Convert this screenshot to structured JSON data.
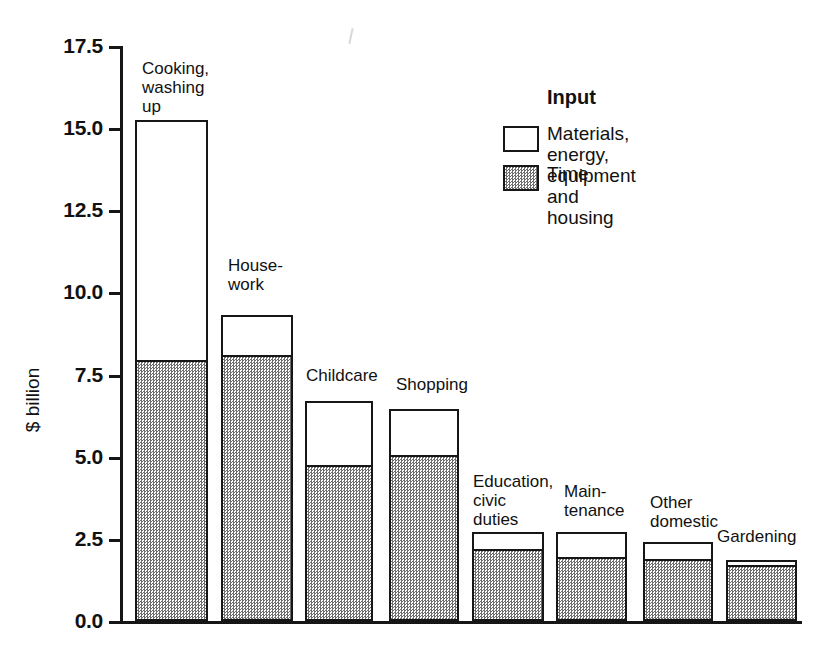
{
  "chart_data": {
    "type": "bar",
    "subtype": "stacked-vertical",
    "title": "",
    "xlabel": "",
    "ylabel": "$ billion",
    "ylim": [
      0.0,
      17.5
    ],
    "yticks": [
      "0.0",
      "2.5",
      "5.0",
      "7.5",
      "10.0",
      "12.5",
      "15.0",
      "17.5"
    ],
    "ytick_values": [
      0.0,
      2.5,
      5.0,
      7.5,
      10.0,
      12.5,
      15.0,
      17.5
    ],
    "grid": false,
    "legend_position": "top-right",
    "legend_title": "Input",
    "categories": [
      "Cooking,\nwashing\nup",
      "House-\nwork",
      "Childcare",
      "Shopping",
      "Education,\ncivic\nduties",
      "Main-\ntenance",
      "Other\ndomestic",
      "Gardening"
    ],
    "series": [
      {
        "name": "Time",
        "values": [
          7.95,
          8.1,
          4.75,
          5.05,
          2.2,
          1.95,
          1.9,
          1.7
        ]
      },
      {
        "name": "Materials, energy,\nequipment and housing",
        "values": [
          7.3,
          1.2,
          1.95,
          1.4,
          0.5,
          0.75,
          0.5,
          0.15
        ]
      }
    ],
    "totals": [
      15.25,
      9.3,
      6.7,
      6.45,
      2.7,
      2.7,
      2.4,
      1.85
    ]
  },
  "legend": {
    "title": "Input",
    "entries": [
      {
        "label": "Materials, energy,\nequipment and housing",
        "swatch": "white-box"
      },
      {
        "label": "Time",
        "swatch": "stippled-box"
      }
    ]
  },
  "axis": {
    "y_title": "$ billion"
  },
  "colors": {
    "ink": "#161616",
    "materials_fill": "#ffffff",
    "time_fill": "#cfcfcf",
    "background": "#ffffff"
  }
}
